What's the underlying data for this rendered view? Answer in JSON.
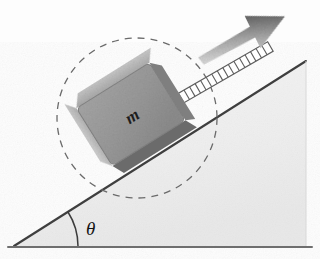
{
  "figure": {
    "name": "block-on-inclined-plane",
    "width": 320,
    "height": 259,
    "background_color": "#fdfdfd"
  },
  "labels": {
    "mass": "m",
    "angle": "θ"
  },
  "incline": {
    "name": "inclined-plane",
    "fill_color": "#efefef",
    "edge_color": "#4a4a4a",
    "apex_x": 306,
    "apex_y": 61,
    "left_vertex_x": 14,
    "left_vertex_y": 246,
    "right_vertex_x": 306,
    "right_vertex_y": 246,
    "angle_degrees": 32
  },
  "baseline": {
    "name": "ground-line",
    "color": "#6e6e6e",
    "x1": 8,
    "y1": 247,
    "x2": 312,
    "y2": 247
  },
  "angle_arc": {
    "name": "angle-arc",
    "color": "#3c3c3c",
    "radius": 64
  },
  "block": {
    "name": "mass-block",
    "center_x": 132,
    "center_y": 116,
    "size": 86,
    "rotation_degrees": -32,
    "face_color": "#9a9a9a",
    "top_face_color": "#b9b9b9",
    "left_face_color": "#c4c4c4",
    "bottom_edge_color": "#6b6b6b",
    "outline_color": "#7c7c7c"
  },
  "dashed_circle": {
    "name": "dashed-circle",
    "center_x": 137,
    "center_y": 118,
    "radius": 80,
    "color": "#6a6a6a",
    "dash_pattern": "7 6"
  },
  "cord": {
    "name": "ladder-cord",
    "start_x": 176,
    "start_y": 101,
    "end_x": 270,
    "end_y": 46,
    "rung_count": 17,
    "color": "#5d5d5d",
    "fill_color": "#ffffff"
  },
  "force_arrow": {
    "name": "applied-force-arrow",
    "direction_degrees": -30,
    "gradient_start_color": "#e2e2e2",
    "gradient_end_color": "#4f4f4f",
    "tip_x": 283,
    "tip_y": 14,
    "tail_x": 196,
    "tail_y": 53
  }
}
